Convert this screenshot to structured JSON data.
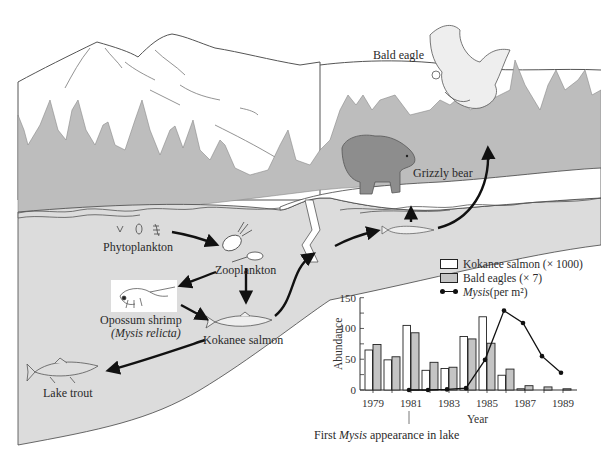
{
  "organisms": {
    "bald_eagle": "Bald eagle",
    "grizzly_bear": "Grizzly bear",
    "phytoplankton": "Phytoplankton",
    "zooplankton": "Zooplankton",
    "opossum_shrimp": "Opossum shrimp",
    "opossum_shrimp_latin": "(Mysis relicta)",
    "kokanee_salmon": "Kokanee salmon",
    "lake_trout": "Lake trout"
  },
  "annotation": {
    "first_mysis_prefix": "First ",
    "first_mysis_italic": "Mysis",
    "first_mysis_suffix": " appearance in lake"
  },
  "legend": {
    "kokanee": "Kokanee salmon (× 1000)",
    "eagles": "Bald eagles (× 7)",
    "mysis_italic": "Mysis",
    "mysis_suffix": " (per m²)"
  },
  "colors": {
    "lake": "#dcdcdc",
    "forest": "#bdbdbd",
    "eagle_bar": "#c4c4c4",
    "kokanee_bar": "#ffffff",
    "line": "#111111"
  },
  "chart_data": {
    "type": "bar",
    "title": "",
    "xlabel": "Year",
    "ylabel": "Abundance",
    "ylim": [
      0,
      150
    ],
    "yticks": [
      0,
      50,
      100,
      150
    ],
    "xtick_labels": [
      "1979",
      "1981",
      "1983",
      "1985",
      "1987",
      "1989"
    ],
    "categories": [
      "1979",
      "1980",
      "1981",
      "1982",
      "1983",
      "1984",
      "1985",
      "1986",
      "1987",
      "1988",
      "1989"
    ],
    "series": [
      {
        "name": "Kokanee salmon (× 1000)",
        "kind": "bar",
        "values": [
          65,
          49,
          105,
          32,
          35,
          87,
          119,
          24,
          2,
          0,
          0
        ]
      },
      {
        "name": "Bald eagles (× 7)",
        "kind": "bar",
        "values": [
          74,
          54,
          93,
          45,
          37,
          83,
          76,
          34,
          7,
          5,
          2
        ]
      },
      {
        "name": "Mysis (per m²)",
        "kind": "line",
        "x": [
          "1981",
          "1982",
          "1983",
          "1984",
          "1985",
          "1986",
          "1987",
          "1988",
          "1989"
        ],
        "values": [
          0,
          0,
          1,
          3,
          49,
          129,
          109,
          55,
          28
        ]
      }
    ],
    "annotations": [
      {
        "x": "1981",
        "text": "First Mysis appearance in lake"
      }
    ],
    "legend_position": "top-right",
    "grid": false
  }
}
